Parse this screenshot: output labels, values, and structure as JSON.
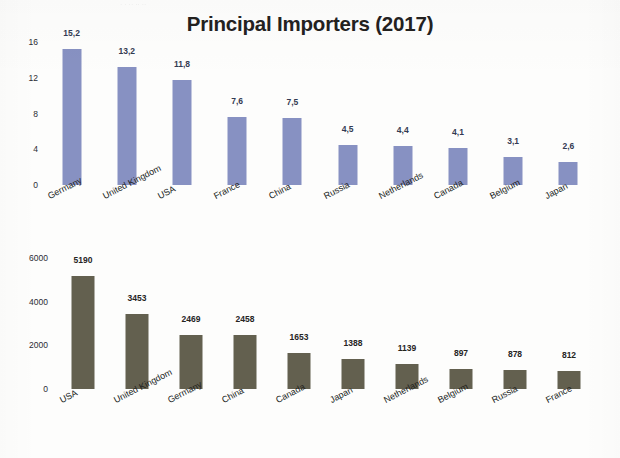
{
  "document": {
    "title": "Principal Importers (2017)",
    "ghost_header": "·  ·           ·· ··              ··"
  },
  "chart_data": [
    {
      "id": "importers-share",
      "type": "bar",
      "title": "Principal Importers (2017)",
      "xlabel": "",
      "ylabel": "",
      "ylim": [
        0,
        16
      ],
      "yticks": [
        0,
        4,
        8,
        12,
        16
      ],
      "ytick_labels": [
        "0",
        "4",
        "8",
        "12",
        "16"
      ],
      "grid": false,
      "legend": "none",
      "bar_color": "#8791c2",
      "label_color": "#333a52",
      "categories": [
        "Germany",
        "United Kingdom",
        "USA",
        "France",
        "China",
        "Russia",
        "Netherlands",
        "Canada",
        "Belgium",
        "Japan"
      ],
      "values": [
        15.2,
        13.2,
        11.8,
        7.6,
        7.5,
        4.5,
        4.4,
        4.1,
        3.1,
        2.6
      ],
      "value_labels": [
        "15,2",
        "13,2",
        "11,8",
        "7,6",
        "7,5",
        "4,5",
        "4,4",
        "4,1",
        "3,1",
        "2,6"
      ]
    },
    {
      "id": "importers-value",
      "type": "bar",
      "title": "",
      "xlabel": "",
      "ylabel": "",
      "ylim": [
        0,
        6000
      ],
      "yticks": [
        0,
        2000,
        4000,
        6000
      ],
      "ytick_labels": [
        "0",
        "2000",
        "4000",
        "6000"
      ],
      "grid": false,
      "legend": "none",
      "bar_color": "#63604f",
      "label_color": "#26241f",
      "categories": [
        "USA",
        "United Kingdom",
        "Germany",
        "China",
        "Canada",
        "Japan",
        "Netherlands",
        "Belgium",
        "Russia",
        "France"
      ],
      "values": [
        5190,
        3453,
        2469,
        2458,
        1653,
        1388,
        1139,
        897,
        878,
        812
      ],
      "value_labels": [
        "5190",
        "3453",
        "2469",
        "2458",
        "1653",
        "1388",
        "1139",
        "897",
        "878",
        "812"
      ]
    }
  ]
}
